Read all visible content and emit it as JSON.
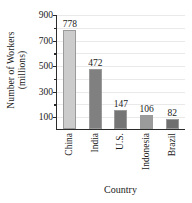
{
  "chart_data": {
    "type": "bar",
    "title": "",
    "categories": [
      "China",
      "India",
      "U.S.",
      "Indonesia",
      "Brazil"
    ],
    "values": [
      778,
      472,
      147,
      106,
      82
    ],
    "value_labels": [
      "778",
      "472",
      "147",
      "106",
      "82"
    ],
    "bar_colors": [
      "#cccccc",
      "#808080",
      "#757575",
      "#9b9b9b",
      "#6f6f6f"
    ],
    "xlabel": "Country",
    "ylabel_line1": "Number of Workers",
    "ylabel_line2": "(millions)",
    "ylim": [
      0,
      900
    ],
    "ytick_labels": [
      "900",
      "700",
      "500",
      "300",
      "100"
    ],
    "ytick_values": [
      900,
      700,
      500,
      300,
      100
    ],
    "yminor_values": [
      800,
      600,
      400,
      200
    ],
    "grid": true,
    "gridline_values": [
      900,
      800,
      700,
      600,
      500,
      400,
      300,
      200,
      100
    ],
    "grid_color": "#e9e9e9",
    "axis_color": "#2b2b2b",
    "legend": "none"
  }
}
